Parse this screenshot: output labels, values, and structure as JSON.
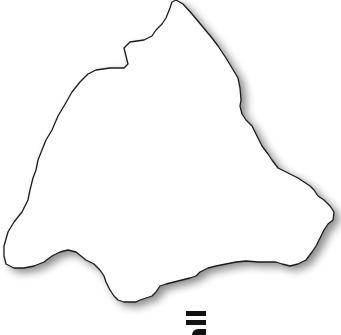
{
  "map": {
    "type": "region-outline",
    "fill": "#ffffff",
    "stroke": "#1a1a1a",
    "shadow": "#9a9a9a",
    "outline_points": [
      [
        176,
        0
      ],
      [
        183,
        4
      ],
      [
        192,
        14
      ],
      [
        202,
        26
      ],
      [
        212,
        38
      ],
      [
        218,
        46
      ],
      [
        222,
        52
      ],
      [
        226,
        58
      ],
      [
        232,
        68
      ],
      [
        238,
        78
      ],
      [
        240,
        88
      ],
      [
        241,
        100
      ],
      [
        240,
        106
      ],
      [
        242,
        114
      ],
      [
        246,
        120
      ],
      [
        252,
        126
      ],
      [
        256,
        134
      ],
      [
        262,
        146
      ],
      [
        268,
        154
      ],
      [
        272,
        160
      ],
      [
        278,
        168
      ],
      [
        282,
        170
      ],
      [
        290,
        174
      ],
      [
        298,
        178
      ],
      [
        304,
        182
      ],
      [
        310,
        186
      ],
      [
        314,
        190
      ],
      [
        318,
        196
      ],
      [
        324,
        200
      ],
      [
        330,
        206
      ],
      [
        334,
        212
      ],
      [
        333,
        220
      ],
      [
        328,
        224
      ],
      [
        324,
        230
      ],
      [
        320,
        238
      ],
      [
        316,
        246
      ],
      [
        312,
        252
      ],
      [
        306,
        260
      ],
      [
        298,
        264
      ],
      [
        290,
        266
      ],
      [
        282,
        264
      ],
      [
        276,
        262
      ],
      [
        268,
        262
      ],
      [
        258,
        262
      ],
      [
        246,
        261
      ],
      [
        236,
        262
      ],
      [
        226,
        264
      ],
      [
        216,
        266
      ],
      [
        208,
        268
      ],
      [
        200,
        272
      ],
      [
        196,
        276
      ],
      [
        190,
        278
      ],
      [
        182,
        280
      ],
      [
        174,
        282
      ],
      [
        166,
        284
      ],
      [
        160,
        286
      ],
      [
        156,
        292
      ],
      [
        152,
        296
      ],
      [
        146,
        298
      ],
      [
        140,
        300
      ],
      [
        136,
        302
      ],
      [
        130,
        302
      ],
      [
        124,
        302
      ],
      [
        118,
        300
      ],
      [
        114,
        296
      ],
      [
        110,
        290
      ],
      [
        106,
        282
      ],
      [
        104,
        276
      ],
      [
        100,
        270
      ],
      [
        94,
        264
      ],
      [
        86,
        260
      ],
      [
        76,
        252
      ],
      [
        68,
        250
      ],
      [
        60,
        252
      ],
      [
        52,
        256
      ],
      [
        44,
        262
      ],
      [
        34,
        266
      ],
      [
        24,
        268
      ],
      [
        14,
        268
      ],
      [
        6,
        264
      ],
      [
        4,
        256
      ],
      [
        4,
        246
      ],
      [
        8,
        232
      ],
      [
        14,
        222
      ],
      [
        22,
        212
      ],
      [
        28,
        200
      ],
      [
        30,
        190
      ],
      [
        33,
        178
      ],
      [
        36,
        170
      ],
      [
        38,
        160
      ],
      [
        42,
        150
      ],
      [
        46,
        140
      ],
      [
        52,
        130
      ],
      [
        58,
        116
      ],
      [
        64,
        106
      ],
      [
        72,
        92
      ],
      [
        80,
        82
      ],
      [
        88,
        74
      ],
      [
        96,
        70
      ],
      [
        110,
        68
      ],
      [
        124,
        68
      ],
      [
        128,
        64
      ],
      [
        126,
        56
      ],
      [
        124,
        48
      ],
      [
        130,
        42
      ],
      [
        144,
        40
      ],
      [
        152,
        36
      ],
      [
        156,
        30
      ],
      [
        162,
        24
      ],
      [
        166,
        18
      ],
      [
        170,
        8
      ],
      [
        172,
        2
      ]
    ]
  },
  "logo": {
    "icon": "logo-glyph",
    "color": "#111111"
  }
}
